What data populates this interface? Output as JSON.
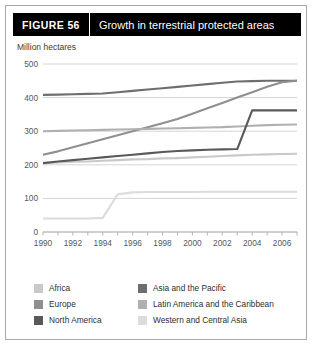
{
  "header": {
    "figure_tag": "FIGURE  56",
    "title": "Growth in terrestrial protected areas"
  },
  "chart_data": {
    "type": "line",
    "title": "Growth in terrestrial protected areas",
    "xlabel": "",
    "ylabel": "Million hectares",
    "unit_label": "Million hectares",
    "grid": true,
    "legend_position": "bottom",
    "xlim": [
      1990,
      2007
    ],
    "ylim": [
      0,
      500
    ],
    "yticks": [
      0,
      100,
      200,
      300,
      400,
      500
    ],
    "xticks": [
      1990,
      1992,
      1994,
      1996,
      1998,
      2000,
      2002,
      2004,
      2006
    ],
    "x": [
      1990,
      1991,
      1992,
      1993,
      1994,
      1995,
      1996,
      1997,
      1998,
      1999,
      2000,
      2001,
      2002,
      2003,
      2004,
      2005,
      2006,
      2007
    ],
    "series": [
      {
        "name": "Africa",
        "color": "#c9c9c9",
        "values": [
          205,
          207,
          209,
          210,
          212,
          214,
          216,
          217,
          219,
          220,
          222,
          224,
          226,
          228,
          230,
          231,
          232,
          233
        ]
      },
      {
        "name": "Asia and the Pacific",
        "color": "#6e6e6e",
        "values": [
          408,
          409,
          410,
          411,
          412,
          416,
          420,
          424,
          428,
          432,
          436,
          440,
          444,
          448,
          449,
          450,
          450,
          450
        ]
      },
      {
        "name": "Europe",
        "color": "#8f8f8f",
        "values": [
          230,
          240,
          252,
          264,
          276,
          288,
          300,
          312,
          324,
          336,
          352,
          368,
          384,
          400,
          416,
          432,
          446,
          450
        ]
      },
      {
        "name": "Latin America and the Caribbean",
        "color": "#b0b0b0",
        "values": [
          300,
          301,
          302,
          303,
          304,
          305,
          306,
          307,
          308,
          309,
          310,
          311,
          312,
          314,
          316,
          318,
          319,
          320
        ]
      },
      {
        "name": "North America",
        "color": "#595959",
        "values": [
          205,
          210,
          214,
          218,
          222,
          226,
          230,
          234,
          238,
          241,
          243,
          245,
          246,
          247,
          362,
          362,
          362,
          362
        ]
      },
      {
        "name": "Western and Central Asia",
        "color": "#dcdcdc",
        "values": [
          40,
          40,
          40,
          40,
          42,
          112,
          118,
          119,
          119,
          119,
          119,
          120,
          120,
          120,
          120,
          120,
          120,
          120
        ]
      }
    ]
  },
  "legend": {
    "entries": [
      {
        "label": "Africa",
        "color": "#c9c9c9"
      },
      {
        "label": "Asia and the Pacific",
        "color": "#6e6e6e"
      },
      {
        "label": "Europe",
        "color": "#8f8f8f"
      },
      {
        "label": "Latin America and the Caribbean",
        "color": "#b0b0b0"
      },
      {
        "label": "North America",
        "color": "#595959"
      },
      {
        "label": "Western and Central Asia",
        "color": "#dcdcdc"
      }
    ]
  }
}
